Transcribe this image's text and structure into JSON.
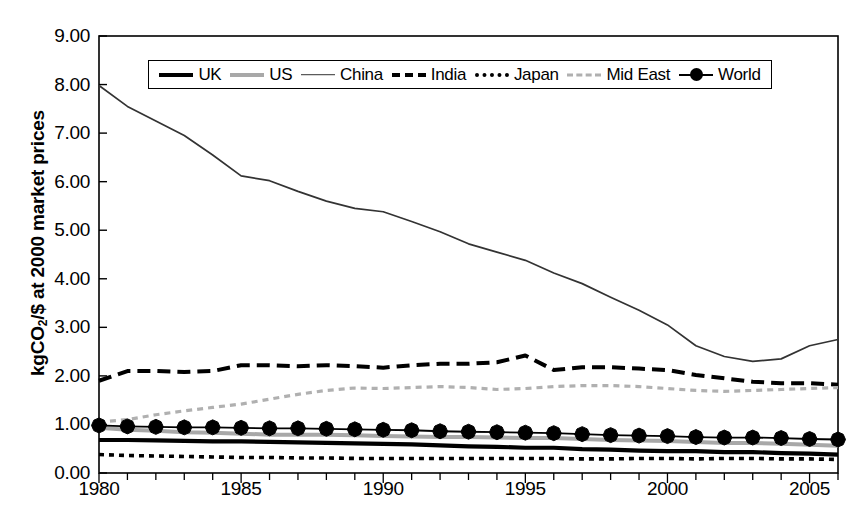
{
  "chart_data": {
    "type": "line",
    "title": "",
    "xlabel": "",
    "ylabel": "kgCO2/$ at 2000 market prices",
    "ylabel_prefix": "kgCO",
    "ylabel_sub": "2",
    "ylabel_suffix": "/$ at 2000 market prices",
    "xlim": [
      1980,
      2006
    ],
    "ylim": [
      0.0,
      9.0
    ],
    "grid": false,
    "legend_position": "top-center-inside",
    "ytick_labels": [
      "0.00",
      "1.00",
      "2.00",
      "3.00",
      "4.00",
      "5.00",
      "6.00",
      "7.00",
      "8.00",
      "9.00"
    ],
    "ytick_values": [
      0,
      1,
      2,
      3,
      4,
      5,
      6,
      7,
      8,
      9
    ],
    "xtick_labels": [
      "1980",
      "1985",
      "1990",
      "1995",
      "2000",
      "2005"
    ],
    "xtick_values": [
      1980,
      1985,
      1990,
      1995,
      2000,
      2005
    ],
    "x": [
      1980,
      1981,
      1982,
      1983,
      1984,
      1985,
      1986,
      1987,
      1988,
      1989,
      1990,
      1991,
      1992,
      1993,
      1994,
      1995,
      1996,
      1997,
      1998,
      1999,
      2000,
      2001,
      2002,
      2003,
      2004,
      2005,
      2006
    ],
    "series": [
      {
        "name": "UK",
        "style": "solid-thick-black",
        "color": "#000000",
        "values": [
          0.68,
          0.68,
          0.67,
          0.66,
          0.65,
          0.65,
          0.64,
          0.63,
          0.62,
          0.61,
          0.6,
          0.59,
          0.57,
          0.55,
          0.54,
          0.52,
          0.52,
          0.49,
          0.48,
          0.46,
          0.45,
          0.45,
          0.43,
          0.43,
          0.41,
          0.4,
          0.38
        ]
      },
      {
        "name": "US",
        "style": "solid-thick-gray",
        "color": "#a8a8a8",
        "values": [
          0.93,
          0.89,
          0.87,
          0.84,
          0.83,
          0.81,
          0.79,
          0.79,
          0.79,
          0.78,
          0.76,
          0.75,
          0.74,
          0.74,
          0.73,
          0.72,
          0.72,
          0.7,
          0.68,
          0.67,
          0.66,
          0.64,
          0.62,
          0.62,
          0.6,
          0.58,
          0.56
        ]
      },
      {
        "name": "China",
        "style": "solid-thin-black",
        "color": "#333333",
        "values": [
          7.98,
          7.55,
          7.25,
          6.95,
          6.55,
          6.12,
          6.02,
          5.8,
          5.6,
          5.45,
          5.38,
          5.18,
          4.97,
          4.72,
          4.55,
          4.38,
          4.12,
          3.9,
          3.62,
          3.35,
          3.05,
          2.62,
          2.4,
          2.3,
          2.35,
          2.62,
          2.75
        ]
      },
      {
        "name": "India",
        "style": "dashed-black",
        "color": "#000000",
        "values": [
          1.9,
          2.1,
          2.1,
          2.08,
          2.1,
          2.22,
          2.22,
          2.2,
          2.22,
          2.2,
          2.17,
          2.22,
          2.25,
          2.25,
          2.28,
          2.42,
          2.12,
          2.18,
          2.18,
          2.15,
          2.12,
          2.02,
          1.95,
          1.88,
          1.85,
          1.85,
          1.82
        ]
      },
      {
        "name": "Japan",
        "style": "dotted-black",
        "color": "#000000",
        "values": [
          0.38,
          0.36,
          0.35,
          0.34,
          0.33,
          0.32,
          0.32,
          0.31,
          0.31,
          0.3,
          0.3,
          0.3,
          0.3,
          0.3,
          0.3,
          0.3,
          0.3,
          0.29,
          0.29,
          0.3,
          0.3,
          0.29,
          0.3,
          0.3,
          0.29,
          0.29,
          0.28
        ]
      },
      {
        "name": "Mid East",
        "style": "dashed-gray",
        "color": "#b0b0b0",
        "values": [
          1.05,
          1.1,
          1.2,
          1.28,
          1.35,
          1.42,
          1.52,
          1.62,
          1.7,
          1.75,
          1.74,
          1.76,
          1.78,
          1.76,
          1.72,
          1.74,
          1.78,
          1.8,
          1.8,
          1.78,
          1.74,
          1.7,
          1.68,
          1.7,
          1.72,
          1.74,
          1.76
        ]
      },
      {
        "name": "World",
        "style": "solid-black-diamond-markers",
        "color": "#000000",
        "marker": "diamond",
        "values": [
          0.98,
          0.96,
          0.95,
          0.94,
          0.94,
          0.93,
          0.92,
          0.92,
          0.91,
          0.9,
          0.89,
          0.88,
          0.86,
          0.85,
          0.84,
          0.83,
          0.82,
          0.8,
          0.78,
          0.77,
          0.76,
          0.74,
          0.73,
          0.73,
          0.72,
          0.7,
          0.69
        ]
      }
    ]
  },
  "legend": {
    "items": [
      {
        "label": "UK",
        "swatch": "line-solid-thick-black-swatch"
      },
      {
        "label": "US",
        "swatch": "line-solid-thick-gray-swatch"
      },
      {
        "label": "China",
        "swatch": "line-solid-thin-black-swatch"
      },
      {
        "label": "India",
        "swatch": "line-dashed-black-swatch"
      },
      {
        "label": "Japan",
        "swatch": "line-dotted-black-swatch"
      },
      {
        "label": "Mid East",
        "swatch": "line-dashed-gray-swatch"
      },
      {
        "label": "World",
        "swatch": "line-diamond-marker-swatch"
      }
    ]
  }
}
